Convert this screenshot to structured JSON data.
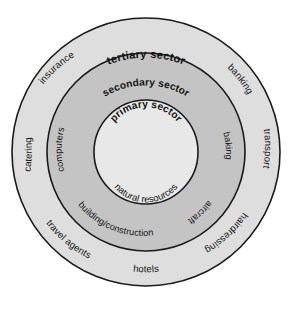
{
  "diagram": {
    "type": "concentric-sector-diagram",
    "colors": {
      "outer_ring_fill": "#dedede",
      "middle_ring_fill": "#c4c4c4",
      "inner_circle_fill": "#e8e8e8",
      "stroke": "#1a1a1a",
      "text": "#141414",
      "background": "#ffffff"
    },
    "geometry": {
      "center_x": 146,
      "center_y": 152,
      "outer_radius": 134,
      "middle_radius": 99,
      "inner_radius": 52
    },
    "rings": [
      {
        "id": "tertiary",
        "label": "tertiary sector",
        "items": [
          "banking",
          "transport",
          "hairdressing",
          "hotels",
          "travel agents",
          "catering",
          "insurance"
        ]
      },
      {
        "id": "secondary",
        "label": "secondary sector",
        "items": [
          "baking",
          "aircraft",
          "building/construction",
          "computers"
        ]
      },
      {
        "id": "primary",
        "label": "primary sector",
        "items": [
          "natural resources"
        ]
      }
    ]
  }
}
